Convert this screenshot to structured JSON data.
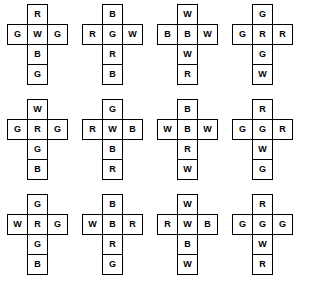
{
  "figure": {
    "title": "",
    "net_shape": "cross",
    "cell_positions": [
      "top",
      "left",
      "middle",
      "right",
      "lower",
      "bottom"
    ],
    "letters_used": [
      "R",
      "G",
      "B",
      "W"
    ],
    "rows": 3,
    "columns": 4,
    "colors": {
      "stroke": "#000000",
      "fill": "#ffffff",
      "text": "#000000",
      "background": "#ffffff"
    }
  },
  "nets": [
    {
      "index": 1,
      "top": "R",
      "left": "G",
      "middle": "W",
      "right": "G",
      "lower": "B",
      "bottom": "G"
    },
    {
      "index": 2,
      "top": "B",
      "left": "R",
      "middle": "G",
      "right": "W",
      "lower": "R",
      "bottom": "B"
    },
    {
      "index": 3,
      "top": "W",
      "left": "B",
      "middle": "B",
      "right": "W",
      "lower": "W",
      "bottom": "R"
    },
    {
      "index": 4,
      "top": "G",
      "left": "G",
      "middle": "R",
      "right": "R",
      "lower": "G",
      "bottom": "W"
    },
    {
      "index": 5,
      "top": "W",
      "left": "G",
      "middle": "R",
      "right": "G",
      "lower": "G",
      "bottom": "B"
    },
    {
      "index": 6,
      "top": "G",
      "left": "R",
      "middle": "W",
      "right": "B",
      "lower": "B",
      "bottom": "R"
    },
    {
      "index": 7,
      "top": "B",
      "left": "W",
      "middle": "B",
      "right": "W",
      "lower": "R",
      "bottom": "W"
    },
    {
      "index": 8,
      "top": "R",
      "left": "G",
      "middle": "G",
      "right": "R",
      "lower": "W",
      "bottom": "G"
    },
    {
      "index": 9,
      "top": "G",
      "left": "W",
      "middle": "R",
      "right": "G",
      "lower": "G",
      "bottom": "B"
    },
    {
      "index": 10,
      "top": "B",
      "left": "W",
      "middle": "B",
      "right": "R",
      "lower": "R",
      "bottom": "G"
    },
    {
      "index": 11,
      "top": "W",
      "left": "R",
      "middle": "W",
      "right": "B",
      "lower": "B",
      "bottom": "W"
    },
    {
      "index": 12,
      "top": "R",
      "left": "G",
      "middle": "G",
      "right": "G",
      "lower": "W",
      "bottom": "R"
    }
  ]
}
